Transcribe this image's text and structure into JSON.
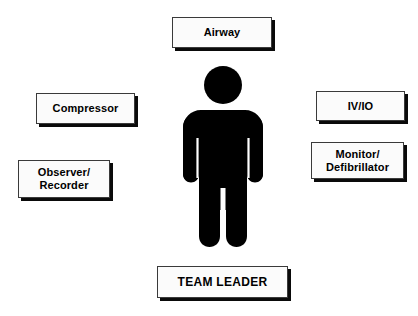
{
  "diagram": {
    "background_color": "#ffffff",
    "box_fill_color": "#fbfbfb",
    "box_border_color": "#3a3a3a",
    "shadow_color": "#0a0a0a",
    "figure_color": "#000000",
    "center_figure": {
      "icon": "person-figure-icon",
      "label": ""
    },
    "roles": [
      {
        "id": "airway",
        "label": "Airway",
        "position": "top"
      },
      {
        "id": "compressor",
        "label": "Compressor",
        "position": "left-upper"
      },
      {
        "id": "observer",
        "label": "Observer/\nRecorder",
        "position": "left-lower"
      },
      {
        "id": "ivio",
        "label": "IV/IO",
        "position": "right-upper"
      },
      {
        "id": "monitor",
        "label": "Monitor/\nDefibrillator",
        "position": "right-lower"
      },
      {
        "id": "team_leader",
        "label": "TEAM LEADER",
        "position": "bottom"
      }
    ]
  }
}
